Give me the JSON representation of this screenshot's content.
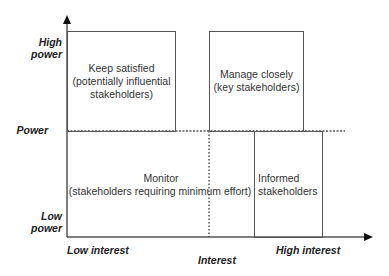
{
  "diagram": {
    "type": "power-interest-grid",
    "y_axis": {
      "title": "Power",
      "high_label": "High power",
      "high_label_lines": [
        "High",
        "power"
      ],
      "low_label_lines": [
        "Low",
        "power"
      ]
    },
    "x_axis": {
      "title": "Interest",
      "low_label": "Low interest",
      "high_label": "High interest"
    },
    "quadrants": [
      {
        "id": "keep-satisfied",
        "lines": [
          "Keep satisfied",
          "(potentially influential",
          "stakeholders)"
        ]
      },
      {
        "id": "manage-closely",
        "lines": [
          "Manage closely",
          "(key stakeholders)"
        ]
      },
      {
        "id": "monitor",
        "lines": [
          "Monitor",
          "(stakeholders requiring minimum effort)"
        ]
      },
      {
        "id": "informed",
        "lines": [
          "Informed",
          "stakeholders"
        ]
      }
    ],
    "colors": {
      "line": "#555555",
      "text": "#333333",
      "background": "#ffffff"
    }
  }
}
